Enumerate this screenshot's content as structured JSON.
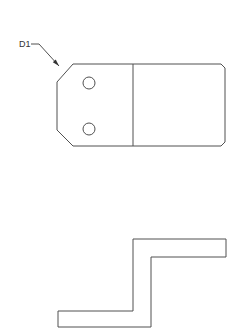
{
  "drawing": {
    "line_color": "#505050",
    "background": "#ffffff",
    "callout": {
      "label": "D1",
      "text_pos": [
        19,
        47
      ],
      "leader": [
        [
          31,
          44
        ],
        [
          39,
          44
        ],
        [
          59,
          66
        ]
      ]
    },
    "top_view": {
      "outline": [
        [
          73,
          64
        ],
        [
          221,
          64
        ],
        [
          225,
          68
        ],
        [
          225,
          142
        ],
        [
          221,
          146
        ],
        [
          73,
          146
        ],
        [
          57,
          130
        ],
        [
          57,
          82
        ]
      ],
      "divider": {
        "x": 133,
        "y1": 64,
        "y2": 146
      },
      "holes": [
        {
          "cx": 89,
          "cy": 83,
          "r": 6
        },
        {
          "cx": 89,
          "cy": 129,
          "r": 6
        }
      ]
    },
    "profile_view": {
      "outline": [
        [
          133,
          239
        ],
        [
          226,
          239
        ],
        [
          226,
          257
        ],
        [
          151,
          257
        ],
        [
          151,
          327
        ],
        [
          58,
          327
        ],
        [
          58,
          311
        ],
        [
          133,
          311
        ]
      ]
    }
  }
}
